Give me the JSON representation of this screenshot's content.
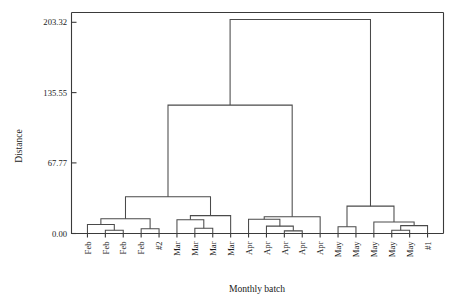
{
  "chart_data": {
    "type": "dendrogram",
    "title": "",
    "xlabel": "Monthly batch",
    "ylabel": "Distance",
    "ylim": [
      0,
      210
    ],
    "grid": false,
    "legend": "none",
    "ytick_labels": [
      "203.32",
      "135.55",
      "67.77",
      "0.00"
    ],
    "ytick_values": [
      203.32,
      135.55,
      67.77,
      0.0
    ],
    "leaf_count": 20,
    "leaf_labels": [
      "Feb",
      "Feb",
      "Feb",
      "Feb",
      "#2",
      "Mar",
      "Mar",
      "Mar",
      "Mar",
      "Apr",
      "Apr",
      "Apr",
      "Apr",
      "Apr",
      "May",
      "May",
      "May",
      "May",
      "May",
      "#1"
    ],
    "linkage_note": "Hierarchical clustering dendrogram; vertical axis is merge distance.",
    "merges": [
      {
        "id": "m1",
        "label": "Feb2+Feb3",
        "left": "leaf:1",
        "right": "leaf:2",
        "height": 3.0
      },
      {
        "id": "m2",
        "label": "Feb1+(Feb2,Feb3)",
        "left": "leaf:0",
        "right": "m1",
        "height": 8.5
      },
      {
        "id": "m3",
        "label": "Feb4+#2",
        "left": "leaf:3",
        "right": "leaf:4",
        "height": 4.5
      },
      {
        "id": "m4",
        "label": "FebCluster",
        "left": "m2",
        "right": "m3",
        "height": 14.0
      },
      {
        "id": "m5",
        "label": "Mar2+Mar3",
        "left": "leaf:6",
        "right": "leaf:7",
        "height": 5.0
      },
      {
        "id": "m6",
        "label": "Mar1+(Mar2,Mar3)",
        "left": "leaf:5",
        "right": "m5",
        "height": 13.0
      },
      {
        "id": "m7",
        "label": "MarCluster",
        "left": "m6",
        "right": "leaf:8",
        "height": 17.0
      },
      {
        "id": "m8",
        "label": "Feb+Mar",
        "left": "m4",
        "right": "m7",
        "height": 35.0
      },
      {
        "id": "m9",
        "label": "Apr3+Apr4",
        "left": "leaf:11",
        "right": "leaf:12",
        "height": 2.5
      },
      {
        "id": "m10",
        "label": "Apr2+(Apr3,Apr4)",
        "left": "leaf:10",
        "right": "m9",
        "height": 7.0
      },
      {
        "id": "m11",
        "label": "Apr1+rest",
        "left": "leaf:9",
        "right": "m10",
        "height": 13.5
      },
      {
        "id": "m12",
        "label": "AprCluster",
        "left": "m11",
        "right": "leaf:13",
        "height": 16.0
      },
      {
        "id": "m13",
        "label": "FebMar+Apr",
        "left": "m8",
        "right": "m12",
        "height": 122.0
      },
      {
        "id": "m14",
        "label": "May1+May2",
        "left": "leaf:14",
        "right": "leaf:15",
        "height": 6.5
      },
      {
        "id": "m15",
        "label": "May4+May5",
        "left": "leaf:17",
        "right": "leaf:18",
        "height": 3.0
      },
      {
        "id": "m16",
        "label": "(May4,May5)+#1",
        "left": "m15",
        "right": "leaf:19",
        "height": 7.5
      },
      {
        "id": "m17",
        "label": "May3+right",
        "left": "leaf:16",
        "right": "m16",
        "height": 11.0
      },
      {
        "id": "m18",
        "label": "MayCluster",
        "left": "m14",
        "right": "m17",
        "height": 26.0
      },
      {
        "id": "m19",
        "label": "Root",
        "left": "m13",
        "right": "m18",
        "height": 203.32
      }
    ]
  },
  "axes": {
    "y_title": "Distance",
    "x_title": "Monthly batch"
  },
  "colors": {
    "line": "#4a4a4a",
    "axis": "#3a3a3a",
    "text": "#1a1a1a",
    "background": "#ffffff"
  }
}
